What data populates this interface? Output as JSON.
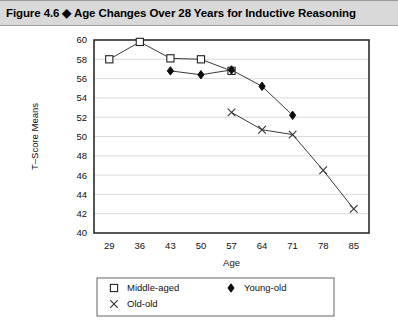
{
  "figure": {
    "label": "Figure 4.6",
    "separator": "◆",
    "title": "Age Changes Over 28 Years for Inductive Reasoning",
    "full_title": "Figure 4.6  ◆  Age Changes Over 28 Years for Inductive Reasoning"
  },
  "colors": {
    "title_bar_bg": "#d9d9d9",
    "title_bar_border": "#9a9a9a",
    "axis": "#2b2b2b",
    "grid": "#d2d2d2",
    "line": "#3a3a3a",
    "marker_fill_open": "#ffffff",
    "marker_fill_solid": "#0d0d0d",
    "background": "#ffffff"
  },
  "chart_data": {
    "type": "line",
    "title": "Age Changes Over 28 Years for Inductive Reasoning",
    "xlabel": "Age",
    "ylabel": "T–Score Means",
    "x": [
      29,
      36,
      43,
      50,
      57,
      64,
      71,
      78,
      85
    ],
    "xtick_labels": [
      "29",
      "36",
      "43",
      "50",
      "57",
      "64",
      "71",
      "78",
      "85"
    ],
    "xlim": [
      25.5,
      88.5
    ],
    "ylim": [
      40,
      60
    ],
    "yticks": [
      40,
      42,
      44,
      46,
      48,
      50,
      52,
      54,
      56,
      58,
      60
    ],
    "ytick_labels": [
      "40",
      "42",
      "44",
      "46",
      "48",
      "50",
      "52",
      "54",
      "56",
      "58",
      "60"
    ],
    "grid": "horizontal",
    "legend_position": "below",
    "series": [
      {
        "name": "Middle-aged",
        "marker": "open-square",
        "x": [
          29,
          36,
          43,
          50,
          57
        ],
        "values": [
          58.0,
          59.8,
          58.1,
          58.0,
          56.8
        ]
      },
      {
        "name": "Young-old",
        "marker": "filled-diamond",
        "x": [
          43,
          50,
          57,
          64,
          71
        ],
        "values": [
          56.8,
          56.4,
          56.9,
          55.2,
          52.2
        ]
      },
      {
        "name": "Old-old",
        "marker": "cross",
        "x": [
          57,
          64,
          71,
          78,
          85
        ],
        "values": [
          52.5,
          50.7,
          50.2,
          46.5,
          42.5
        ]
      }
    ]
  },
  "legend": {
    "entries": [
      {
        "label": "Middle-aged",
        "marker": "open-square"
      },
      {
        "label": "Young-old",
        "marker": "filled-diamond"
      },
      {
        "label": "Old-old",
        "marker": "cross"
      }
    ]
  }
}
